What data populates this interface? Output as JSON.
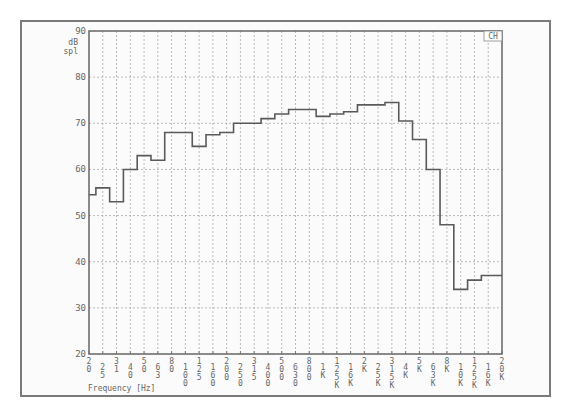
{
  "chart_data": {
    "type": "bar",
    "style": "step",
    "title": "",
    "corner_label": "CH",
    "xlabel": "Frequency [Hz]",
    "ylabel": "dB spl",
    "ylim": [
      20,
      90
    ],
    "yticks": [
      20,
      30,
      40,
      50,
      60,
      70,
      80,
      90
    ],
    "grid": true,
    "legend": null,
    "categories": [
      "20",
      "25",
      "31",
      "40",
      "50",
      "63",
      "80",
      "100",
      "125",
      "160",
      "200",
      "250",
      "315",
      "400",
      "500",
      "630",
      "800",
      "1K",
      "1.25K",
      "1.6K",
      "2K",
      "2.5K",
      "3.15K",
      "4K",
      "5K",
      "6.3K",
      "8K",
      "10K",
      "12.5K",
      "16K",
      "20K"
    ],
    "values": [
      54.5,
      56,
      53,
      60,
      63,
      62,
      68,
      68,
      65,
      67.5,
      68,
      70,
      70,
      71,
      72,
      73,
      73,
      71.5,
      72,
      72.5,
      74,
      74,
      74.5,
      70.5,
      66.5,
      60,
      48,
      34,
      36,
      37,
      37
    ]
  },
  "axis": {
    "y_unit_top": "dB",
    "y_unit_bottom": "spl",
    "x_title": "Frequency [Hz]"
  },
  "colors": {
    "line": "#5a5a5a",
    "grid": "#aaaaaa",
    "frame": "#7a7a7a"
  }
}
